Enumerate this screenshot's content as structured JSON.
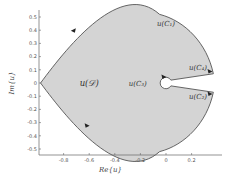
{
  "chart_data": {
    "type": "region",
    "title": "",
    "xlabel": "Re{u}",
    "ylabel": "Im{u}",
    "xlim": [
      -0.98,
      0.38
    ],
    "ylim": [
      -0.55,
      0.58
    ],
    "xticks": [
      -0.8,
      -0.6,
      -0.4,
      -0.2,
      0,
      0.2
    ],
    "xtick_labels": [
      "-0.8",
      "-0.6",
      "-0.4",
      "-0.2",
      "0",
      "0.2"
    ],
    "yticks": [
      0.5,
      0.4,
      0.3,
      0.2,
      0.1,
      0,
      -0.1,
      -0.2,
      -0.3,
      -0.4,
      -0.5
    ],
    "ytick_labels": [
      "0.5",
      "0.4",
      "0.3",
      "0.2",
      "0.1",
      "0",
      "-0.1",
      "-0.2",
      "-0.3",
      "-0.4",
      "-0.5"
    ],
    "grid": false,
    "region": {
      "name": "u(D)",
      "fill_color": "#d4d4d4",
      "edge_color": "#555555",
      "left_vertex": [
        -0.98,
        0.0
      ],
      "upper_tip": [
        0.37,
        0.07
      ],
      "lower_tip": [
        0.37,
        -0.07
      ],
      "hole_center": [
        0.0,
        0.0
      ],
      "hole_radius": 0.045,
      "upper_boundary_top": [
        -0.1,
        0.52
      ],
      "lower_boundary_bottom": [
        -0.1,
        -0.52
      ]
    },
    "annotations": [
      {
        "id": "region",
        "text": "u(𝒟)",
        "x": -0.6,
        "y": 0.0
      },
      {
        "id": "c1",
        "text": "u(C₁)",
        "x": 0.0,
        "y": 0.45
      },
      {
        "id": "c4",
        "text": "u(C₄)",
        "x": 0.25,
        "y": 0.12
      },
      {
        "id": "c3",
        "text": "u(C₃)",
        "x": -0.15,
        "y": 0.0
      },
      {
        "id": "c2",
        "text": "u(C₂)",
        "x": 0.25,
        "y": -0.1
      }
    ],
    "arrows": [
      {
        "on": "upper-boundary",
        "at": [
          -0.72,
          0.4
        ],
        "direction": "left"
      },
      {
        "on": "lower-boundary",
        "at": [
          -0.62,
          -0.32
        ],
        "direction": "right"
      },
      {
        "on": "c4-segment",
        "at": [
          0.34,
          0.09
        ],
        "direction": "right"
      },
      {
        "on": "c2-segment",
        "at": [
          0.34,
          -0.08
        ],
        "direction": "right"
      },
      {
        "on": "c3-circle",
        "at": [
          -0.02,
          0.05
        ],
        "direction": "right"
      }
    ]
  }
}
